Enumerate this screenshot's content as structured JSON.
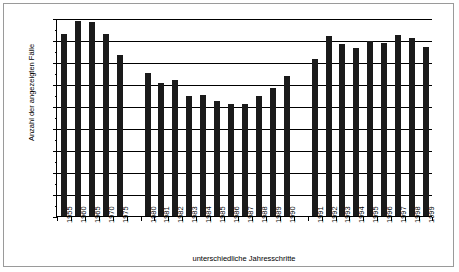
{
  "chart_data": {
    "type": "bar",
    "title": "",
    "xlabel": "unterschiedliche Jahresschritte",
    "ylabel": "Anzahl der angezeigten Fälle",
    "ylim": [
      0,
      18000
    ],
    "ytick_step": 2000,
    "yminor_step": 1000,
    "grid": true,
    "legend": "none",
    "yticks": [
      "18000",
      "16000",
      "14000",
      "12000",
      "10000",
      "8000",
      "6000",
      "4000",
      "2000",
      "0"
    ],
    "categories": [
      "1955",
      "1960",
      "1965",
      "1970",
      "1975",
      "",
      "1980",
      "1981",
      "1982",
      "1983",
      "1984",
      "1985",
      "1986",
      "1987",
      "1988",
      "1989",
      "1990",
      "",
      "1991",
      "1992",
      "1993",
      "1994",
      "1995",
      "1996",
      "1997",
      "1998",
      "1999"
    ],
    "values": [
      16550,
      17750,
      17650,
      16550,
      14600,
      null,
      13000,
      12050,
      12350,
      10900,
      11000,
      10450,
      10200,
      10200,
      10950,
      11600,
      12700,
      null,
      14250,
      16350,
      15600,
      15300,
      15900,
      15750,
      16500,
      16200,
      15350
    ],
    "bar_color": "#1a1a1a"
  },
  "figure": {
    "border_color": "#9a9a9a",
    "axis_color": "#000000",
    "background": "#ffffff"
  }
}
